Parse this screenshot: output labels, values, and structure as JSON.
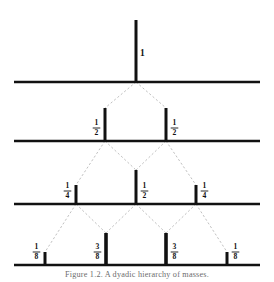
{
  "figure": {
    "background_color": "#ffffff",
    "ink_color": "#111111",
    "edge_color": "#b9b9b9",
    "width": 274,
    "height": 282,
    "root_label": "1",
    "caption": "Figure 1.2.  A dyadic hierarchy of masses."
  },
  "chart_data": {
    "type": "bar",
    "xlabel": "",
    "ylabel": "",
    "grid": false,
    "legend": null,
    "levels": [
      {
        "index": 0,
        "name": "level-0",
        "baseline_y": 82,
        "bars": [
          {
            "label": "1",
            "numerator": "1",
            "denominator": "",
            "value": 1.0,
            "x": 136,
            "height": 62,
            "thickness": 3.0,
            "label_side": "right"
          }
        ]
      },
      {
        "index": 1,
        "name": "level-1",
        "baseline_y": 141,
        "bars": [
          {
            "label": "1/2",
            "numerator": "1",
            "denominator": "2",
            "value": 0.5,
            "x": 105,
            "height": 33,
            "thickness": 3.0,
            "label_side": "left"
          },
          {
            "label": "1/2",
            "numerator": "1",
            "denominator": "2",
            "value": 0.5,
            "x": 166,
            "height": 33,
            "thickness": 3.0,
            "label_side": "right"
          }
        ]
      },
      {
        "index": 2,
        "name": "level-2",
        "baseline_y": 204,
        "bars": [
          {
            "label": "1/4",
            "numerator": "1",
            "denominator": "4",
            "value": 0.25,
            "x": 76,
            "height": 19,
            "thickness": 3.0,
            "label_side": "left"
          },
          {
            "label": "1/2",
            "numerator": "1",
            "denominator": "2",
            "value": 0.5,
            "x": 136,
            "height": 34,
            "thickness": 3.0,
            "label_side": "right"
          },
          {
            "label": "1/4",
            "numerator": "1",
            "denominator": "4",
            "value": 0.25,
            "x": 196,
            "height": 19,
            "thickness": 3.0,
            "label_side": "right"
          }
        ]
      },
      {
        "index": 3,
        "name": "level-3",
        "baseline_y": 265,
        "bars": [
          {
            "label": "1/8",
            "numerator": "1",
            "denominator": "8",
            "value": 0.125,
            "x": 45,
            "height": 13,
            "thickness": 3.0,
            "label_side": "left"
          },
          {
            "label": "3/8",
            "numerator": "3",
            "denominator": "8",
            "value": 0.375,
            "x": 106,
            "height": 32,
            "thickness": 3.6,
            "label_side": "left"
          },
          {
            "label": "3/8",
            "numerator": "3",
            "denominator": "8",
            "value": 0.375,
            "x": 166,
            "height": 32,
            "thickness": 3.6,
            "label_side": "right"
          },
          {
            "label": "1/8",
            "numerator": "1",
            "denominator": "8",
            "value": 0.125,
            "x": 227,
            "height": 13,
            "thickness": 3.0,
            "label_side": "right"
          }
        ]
      }
    ],
    "baselines": [
      {
        "name": "baseline-0",
        "y": 82,
        "x1": 14,
        "x2": 260
      },
      {
        "name": "baseline-1",
        "y": 141,
        "x1": 14,
        "x2": 260
      },
      {
        "name": "baseline-2",
        "y": 204,
        "x1": 14,
        "x2": 260
      },
      {
        "name": "baseline-3",
        "y": 265,
        "x1": 14,
        "x2": 260
      }
    ],
    "edges": [
      {
        "from_x": 136,
        "from_y": 82,
        "to_x": 105,
        "to_y": 108
      },
      {
        "from_x": 136,
        "from_y": 82,
        "to_x": 166,
        "to_y": 108
      },
      {
        "from_x": 105,
        "from_y": 141,
        "to_x": 76,
        "to_y": 185
      },
      {
        "from_x": 105,
        "from_y": 141,
        "to_x": 136,
        "to_y": 170
      },
      {
        "from_x": 166,
        "from_y": 141,
        "to_x": 136,
        "to_y": 170
      },
      {
        "from_x": 166,
        "from_y": 141,
        "to_x": 196,
        "to_y": 185
      },
      {
        "from_x": 76,
        "from_y": 204,
        "to_x": 45,
        "to_y": 252
      },
      {
        "from_x": 76,
        "from_y": 204,
        "to_x": 106,
        "to_y": 233
      },
      {
        "from_x": 136,
        "from_y": 204,
        "to_x": 106,
        "to_y": 233
      },
      {
        "from_x": 136,
        "from_y": 204,
        "to_x": 166,
        "to_y": 233
      },
      {
        "from_x": 196,
        "from_y": 204,
        "to_x": 166,
        "to_y": 233
      },
      {
        "from_x": 196,
        "from_y": 204,
        "to_x": 227,
        "to_y": 252
      }
    ]
  }
}
